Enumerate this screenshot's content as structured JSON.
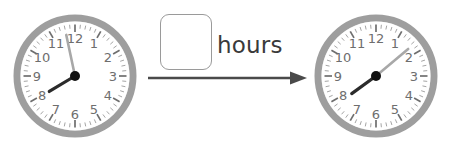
{
  "worksheet": {
    "type": "elapsed-time-problem",
    "unit_label": "hours",
    "answer_value": "",
    "answer_placeholder": ""
  },
  "arrow": {
    "name": "right-arrow",
    "direction": "right",
    "color": "#4a4a4a"
  },
  "colors": {
    "bezel": "#9e9e9e",
    "bezel_shadow": "#b5b5b5",
    "face": "#ffffff",
    "numeral": "#6e6e6e",
    "tick_major": "#6e6e6e",
    "tick_minor": "#9a9a9a",
    "hand_hour": "#2b2b2b",
    "hand_minute": "#a8a8a8",
    "hub": "#111111"
  },
  "clocks": [
    {
      "name": "start-clock",
      "position": "left",
      "time": "7:58",
      "hour_hand_angle_deg": 239,
      "minute_hand_angle_deg": 348,
      "numerals": [
        "12",
        "1",
        "2",
        "3",
        "4",
        "5",
        "6",
        "7",
        "8",
        "9",
        "10",
        "11"
      ],
      "minute_ticks": 60,
      "hour_ticks": 12
    },
    {
      "name": "end-clock",
      "position": "right",
      "time": "7:08",
      "hour_hand_angle_deg": 234,
      "minute_hand_angle_deg": 50,
      "numerals": [
        "12",
        "1",
        "2",
        "3",
        "4",
        "5",
        "6",
        "7",
        "8",
        "9",
        "10",
        "11"
      ],
      "minute_ticks": 60,
      "hour_ticks": 12
    }
  ]
}
